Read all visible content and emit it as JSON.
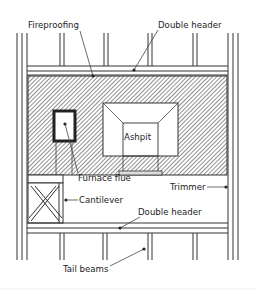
{
  "diagram": {
    "type": "framing plan",
    "labels": {
      "fireproofing": "Fireproofing",
      "double_header_top": "Double header",
      "ashpit": "Ashpit",
      "furnace_flue": "Furnace flue",
      "trimmer": "Trimmer",
      "cantilever": "Cantilever",
      "double_header_bottom": "Double header",
      "tail_beams": "Tail beams"
    },
    "colors": {
      "line": "#333333",
      "hatch": "#555555",
      "background": "#ffffff",
      "text": "#222222"
    }
  }
}
